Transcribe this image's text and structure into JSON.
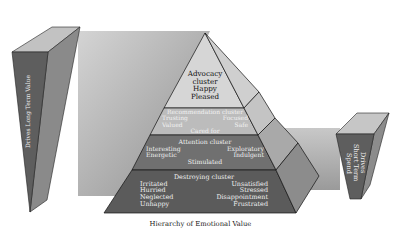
{
  "diagram": {
    "caption": "Hierarchy of Emotional Value",
    "left_wedge": {
      "label": "Drives Long Term Value"
    },
    "right_wedge": {
      "label_lines": [
        "Drives",
        "Short Term",
        "Spend"
      ]
    },
    "tiers": [
      {
        "name": "Advocacy cluster",
        "lines": [
          "Advocacy",
          "cluster",
          "Happy",
          "Pleased"
        ]
      },
      {
        "name": "Recommendation cluster",
        "left": [
          "Trusting",
          "Valued"
        ],
        "right": [
          "Focused",
          "Safe"
        ],
        "center": "Cared for"
      },
      {
        "name": "Attention cluster",
        "left": [
          "Interesting",
          "Energetic"
        ],
        "right": [
          "Exploratory",
          "Indulgent"
        ],
        "center": "Stimulated"
      },
      {
        "name": "Destroying cluster",
        "left": [
          "Irritated",
          "Hurried",
          "Neglected",
          "Unhappy"
        ],
        "right": [
          "Unsatisfied",
          "Stressed",
          "Disappointment",
          "Frustrated"
        ]
      }
    ],
    "colors": {
      "band_light": "#d0d0d0",
      "band_dark": "#8a8a8a",
      "tier1": "#d6d6d6",
      "tier2": "#b9b9b9",
      "tier3": "#6e6e6e",
      "tier4": "#5a5a5a",
      "wedge_front": "#5e5e5e"
    }
  }
}
